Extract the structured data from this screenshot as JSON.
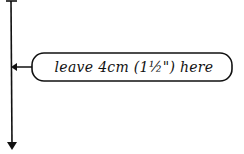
{
  "diagram": {
    "annotation": {
      "text": "leave 4cm (1½\") here"
    },
    "colors": {
      "ink": "#111111",
      "background": "#ffffff"
    }
  }
}
